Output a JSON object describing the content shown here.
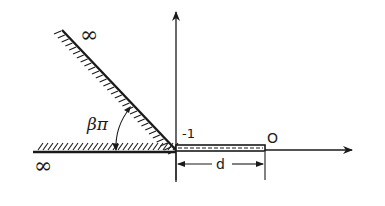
{
  "diagram": {
    "labels": {
      "infinity_top": "∞",
      "infinity_left": "∞",
      "angle": "βπ",
      "minus_one": "-1",
      "origin": "O",
      "length": "d"
    },
    "colors": {
      "ink": "#1a1a1a",
      "background": "#ffffff"
    }
  }
}
